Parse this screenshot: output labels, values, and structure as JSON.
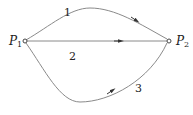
{
  "diagram": {
    "nodes": [
      {
        "id": "P1",
        "label_main": "P",
        "label_sub": "1"
      },
      {
        "id": "P2",
        "label_main": "P",
        "label_sub": "2"
      }
    ],
    "paths": [
      {
        "id": 1,
        "label": "1",
        "from": "P1",
        "to": "P2",
        "shape": "upper arc"
      },
      {
        "id": 2,
        "label": "2",
        "from": "P1",
        "to": "P2",
        "shape": "straight"
      },
      {
        "id": 3,
        "label": "3",
        "from": "P1",
        "to": "P2",
        "shape": "lower arc"
      }
    ],
    "colors": {
      "stroke": "#8a8a8a",
      "text": "#222222",
      "background": "#ffffff"
    }
  }
}
